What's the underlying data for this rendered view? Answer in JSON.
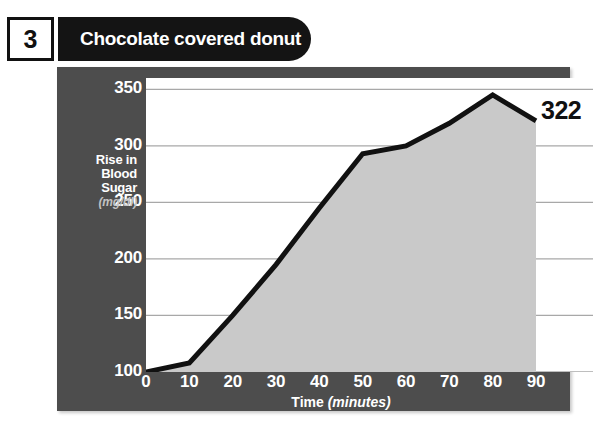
{
  "header": {
    "number": "3",
    "title": "Chocolate covered donut"
  },
  "chart_data": {
    "type": "area",
    "title": "Chocolate covered donut",
    "xlabel": "Time",
    "xlabel_units": "(minutes)",
    "ylabel": "Rise in Blood Sugar",
    "ylabel_units": "(mg/dl)",
    "ylabel_lines": [
      "Rise in",
      "Blood",
      "Sugar"
    ],
    "x": [
      0,
      10,
      20,
      30,
      40,
      50,
      60,
      70,
      80,
      90
    ],
    "values": [
      100,
      108,
      150,
      195,
      245,
      293,
      300,
      320,
      345,
      322
    ],
    "xticks": [
      "0",
      "10",
      "20",
      "30",
      "40",
      "50",
      "60",
      "70",
      "80",
      "90"
    ],
    "yticks": [
      "100",
      "150",
      "200",
      "250",
      "300",
      "350"
    ],
    "ytick_values": [
      100,
      150,
      200,
      250,
      300,
      350
    ],
    "xlim": [
      0,
      90
    ],
    "ylim": [
      100,
      360
    ],
    "grid": true,
    "legend": "none",
    "end_value_label": "322",
    "colors": {
      "panel": "#4d4d4d",
      "plot_background": "#ffffff",
      "area_fill": "#c9c9c9",
      "line": "#111111",
      "gridline": "#a8a8a8",
      "tick_text": "#ffffff",
      "units_text": "#c2c2c2",
      "title_pill": "#141414",
      "title_text": "#ffffff",
      "number_text": "#111111",
      "end_value_text": "#111111"
    }
  }
}
